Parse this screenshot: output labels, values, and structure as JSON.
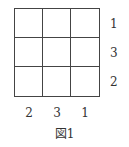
{
  "figure": {
    "caption": "図1",
    "grid": {
      "rows": 3,
      "cols": 3
    },
    "row_labels": [
      "1",
      "3",
      "2"
    ],
    "col_labels": [
      "2",
      "3",
      "1"
    ]
  }
}
